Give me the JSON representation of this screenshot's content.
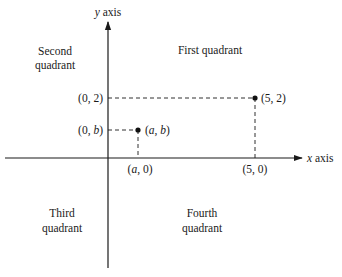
{
  "diagram": {
    "type": "cartesian-plane-quadrants",
    "axes": {
      "x_label_var": "x",
      "x_label_word": "axis",
      "y_label_var": "y",
      "y_label_word": "axis"
    },
    "quadrants": [
      {
        "id": "first",
        "line1": "First quadrant",
        "line2": ""
      },
      {
        "id": "second",
        "line1": "Second",
        "line2": "quadrant"
      },
      {
        "id": "third",
        "line1": "Third",
        "line2": "quadrant"
      },
      {
        "id": "fourth",
        "line1": "Fourth",
        "line2": "quadrant"
      }
    ],
    "points": [
      {
        "id": "ab",
        "x": "a",
        "y": "b",
        "label": "(a, b)",
        "x_proj_label": "(a, 0)",
        "y_proj_label": "(0, b)"
      },
      {
        "id": "52",
        "x": 5,
        "y": 2,
        "label": "(5, 2)",
        "x_proj_label": "(5, 0)",
        "y_proj_label": "(0, 2)"
      }
    ],
    "label_parts": {
      "ab": {
        "open": "(",
        "x": "a",
        "sep": ", ",
        "y": "b",
        "close": ")"
      },
      "a0": {
        "open": "(",
        "x": "a",
        "sep": ", ",
        "y": "0",
        "close": ")"
      },
      "0b": {
        "open": "(",
        "x": "0",
        "sep": ", ",
        "y": "b",
        "close": ")"
      }
    }
  }
}
